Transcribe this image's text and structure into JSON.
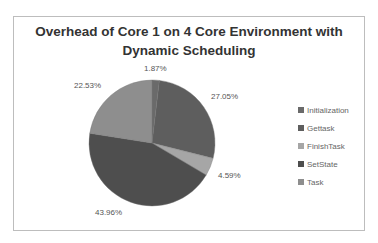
{
  "chart_data": {
    "type": "pie",
    "title": "Overhead of Core 1 on 4 Core Environment with Dynamic Scheduling",
    "title_lines": [
      "Overhead of Core 1 on 4 Core Environment with",
      "Dynamic Scheduling"
    ],
    "categories": [
      "Initialization",
      "Gettask",
      "FinishTask",
      "SetState",
      "Task"
    ],
    "values": [
      1.87,
      27.05,
      4.59,
      43.96,
      22.53
    ],
    "labels": [
      "1.87%",
      "27.05%",
      "4.59%",
      "43.96%",
      "22.53%"
    ],
    "colors": [
      "#6a6a6a",
      "#5e5e5e",
      "#a6a6a6",
      "#4e4e4e",
      "#8e8e8e"
    ],
    "legend_position": "right",
    "start_angle_deg": 0,
    "direction": "clockwise"
  }
}
